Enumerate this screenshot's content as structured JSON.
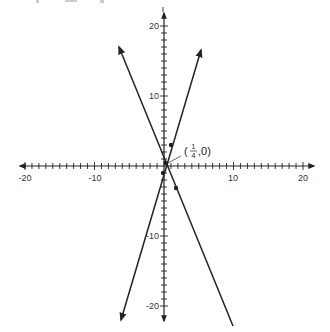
{
  "chart_data": {
    "type": "line",
    "title": "",
    "top_text_fragment": "y = ...",
    "xlabel": "",
    "ylabel": "",
    "xlim": [
      -20,
      20
    ],
    "ylim": [
      -20,
      20
    ],
    "grid": false,
    "x_tick_labels": [
      "-20",
      "-10",
      "10",
      "20"
    ],
    "y_tick_labels": [
      "20",
      "10",
      "-10",
      "-20"
    ],
    "x_tick_values": [
      -20,
      -10,
      10,
      20
    ],
    "y_tick_values": [
      20,
      10,
      -10,
      -20
    ],
    "minor_tick_step": 1,
    "series": [
      {
        "name": "rising line",
        "equation": "y = 4x - 1",
        "endpoints": [
          [
            -6.3,
            -22.1
          ],
          [
            5.3,
            16.6
          ]
        ],
        "marked_points": [
          [
            0,
            -1
          ],
          [
            1,
            3
          ]
        ]
      },
      {
        "name": "falling line",
        "equation": "y ≈ -2.4x + 0.6",
        "endpoints": [
          [
            -6.5,
            17.0
          ],
          [
            10.0,
            -22.9
          ]
        ],
        "marked_points": [
          [
            0.1,
            0.3
          ],
          [
            1.7,
            -3.1
          ]
        ]
      }
    ],
    "annotations": [
      {
        "text_num": "1",
        "text_den": "4",
        "label": "(1/4, 0)",
        "point": [
          0.25,
          0
        ]
      }
    ]
  },
  "annotation": {
    "open": "(",
    "num": "1",
    "den": "4",
    "rest": ",0)"
  },
  "labels": {
    "x_neg20": "-20",
    "x_neg10": "-10",
    "x_10": "10",
    "x_20": "20",
    "y_20": "20",
    "y_10": "10",
    "y_neg10": "-10",
    "y_neg20": "-20"
  }
}
